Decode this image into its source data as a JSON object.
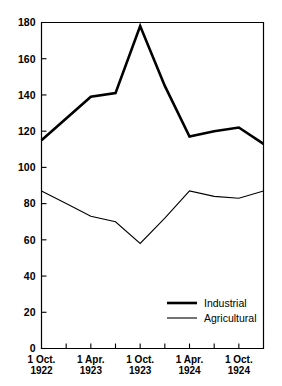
{
  "chart_data": {
    "type": "line",
    "title": "",
    "xlabel": "",
    "ylabel": "",
    "ylim": [
      0,
      180
    ],
    "ytick_step": 20,
    "grid": false,
    "legend_position": "inside-lower-right",
    "ytick_labels": [
      "0",
      "20",
      "40",
      "60",
      "80",
      "100",
      "120",
      "140",
      "160",
      "180"
    ],
    "ytick_values": [
      0,
      20,
      40,
      60,
      80,
      100,
      120,
      140,
      160,
      180
    ],
    "categories": [
      "1 Oct. 1922",
      "1 Jan. 1923",
      "1 Apr. 1923",
      "1 Jul. 1923",
      "1 Oct. 1923",
      "1 Jan. 1924",
      "1 Apr. 1924",
      "1 Jul. 1924",
      "1 Oct. 1924",
      "1 Jan. 1925"
    ],
    "xtick_labels": [
      {
        "line1": "1 Oct.",
        "line2": "1922",
        "index": 0
      },
      {
        "line1": "1 Apr.",
        "line2": "1923",
        "index": 2
      },
      {
        "line1": "1 Oct.",
        "line2": "1923",
        "index": 4
      },
      {
        "line1": "1 Apr.",
        "line2": "1924",
        "index": 6
      },
      {
        "line1": "1 Oct.",
        "line2": "1924",
        "index": 8
      }
    ],
    "series": [
      {
        "name": "Industrial",
        "style": "thick",
        "values": [
          115,
          127,
          139,
          141,
          178,
          145,
          117,
          120,
          122,
          113
        ]
      },
      {
        "name": "Agricultural",
        "style": "thin",
        "values": [
          87,
          80,
          73,
          70,
          58,
          72,
          87,
          84,
          83,
          87
        ]
      }
    ]
  },
  "legend": {
    "entries": [
      {
        "label": "Industrial"
      },
      {
        "label": "Agricultural"
      }
    ]
  }
}
